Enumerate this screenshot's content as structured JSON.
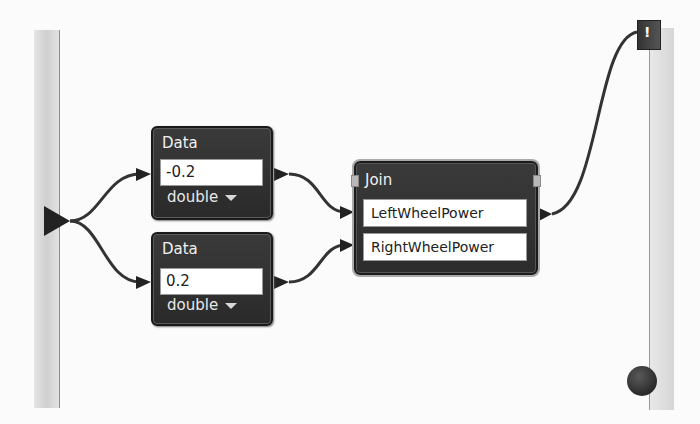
{
  "diagram": {
    "data_nodes": [
      {
        "title": "Data",
        "value": "-0.2",
        "type": "double"
      },
      {
        "title": "Data",
        "value": "0.2",
        "type": "double"
      }
    ],
    "join_node": {
      "title": "Join",
      "fields": [
        "LeftWheelPower",
        "RightWheelPower"
      ]
    },
    "output_port": {
      "glyph": "!"
    },
    "colors": {
      "node_fill": "#2e2e2e",
      "node_border": "#1a1a1a",
      "wire": "#333333",
      "background": "#fbfbfb"
    }
  }
}
